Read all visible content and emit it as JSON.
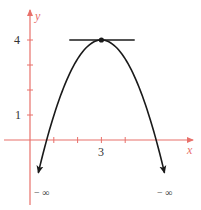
{
  "chart_data": {
    "type": "line",
    "title": "",
    "xlabel": "x",
    "ylabel": "y",
    "x_tick_labels": [
      {
        "value": 3,
        "label": "3"
      }
    ],
    "y_tick_labels": [
      {
        "value": 1,
        "label": "1"
      },
      {
        "value": 4,
        "label": "4"
      }
    ],
    "x_ticks": [
      1,
      2,
      3,
      4
    ],
    "y_ticks": [
      1,
      2,
      3,
      4
    ],
    "xlim": [
      -1.25,
      7.0
    ],
    "ylim": [
      -3.0,
      5.4
    ],
    "grid": false,
    "legend": null,
    "series": [
      {
        "name": "parabola",
        "function": "y = 4 - 0.756*(x-3)^2",
        "vertex": {
          "x": 3,
          "y": 4
        },
        "x": [
          0.35,
          0.6,
          1.0,
          1.5,
          2.0,
          2.5,
          3.0,
          3.5,
          4.0,
          4.5,
          5.0,
          5.4,
          5.65
        ],
        "values": [
          -1.31,
          -0.35,
          0.98,
          2.3,
          3.24,
          3.81,
          4.0,
          3.81,
          3.24,
          2.3,
          0.98,
          -0.35,
          -1.31
        ],
        "end_labels": [
          "− ∞",
          "− ∞"
        ]
      },
      {
        "name": "tangent",
        "x": [
          1.65,
          4.4
        ],
        "values": [
          4,
          4
        ]
      }
    ],
    "annotations": [
      {
        "text": "− ∞",
        "at": "left arrow end"
      },
      {
        "text": "− ∞",
        "at": "right arrow end"
      }
    ],
    "colors": {
      "axis": "#e8706a",
      "curve": "#1a1a1a",
      "text": "#333333"
    }
  },
  "labels": {
    "y_axis": "y",
    "x_axis": "x",
    "y4": "4",
    "y1": "1",
    "x3": "3",
    "neg_inf_left": "− ∞",
    "neg_inf_right": "− ∞"
  }
}
